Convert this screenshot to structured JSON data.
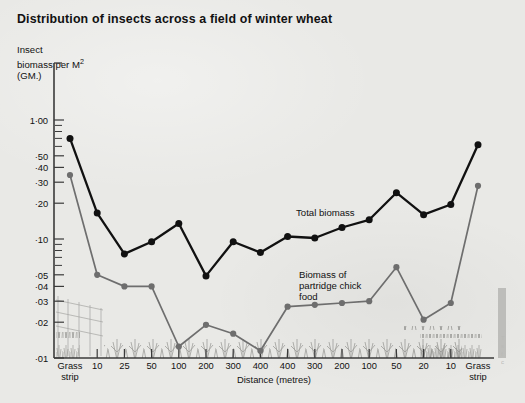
{
  "title": "Distribution of insects across a field of winter wheat",
  "y_axis_label_lines": "Insect\nbiomass per M²\n(GM.)",
  "x_axis_title": "Distance (metres)",
  "annotations": [
    {
      "name": "total-biomass-label",
      "text": "Total biomass",
      "x": 296,
      "y": 208
    },
    {
      "name": "partridge-food-label",
      "text": "Biomass of\npartridge chick\nfood",
      "x": 299,
      "y": 270
    }
  ],
  "right_caption": "T\ns\nf\nc",
  "colors": {
    "background": "#e9e9e6",
    "axis": "#3a3a3a",
    "total_biomass": "#111111",
    "partridge_food": "#6e6e6e",
    "text": "#111111"
  },
  "chart_data": {
    "type": "line",
    "title": "Distribution of insects across a field of winter wheat",
    "xlabel": "Distance (metres)",
    "ylabel": "Insect biomass per M2 (GM.)",
    "yscale": "log",
    "ylim": [
      0.01,
      1.0
    ],
    "grid": false,
    "legend": "inline-annotations",
    "ytick_labels": [
      "1·00",
      "·50",
      "·40",
      "·30",
      "·20",
      "·10",
      "·05",
      "·04",
      "·03",
      "·02",
      "·01"
    ],
    "ytick_values": [
      1.0,
      0.5,
      0.4,
      0.3,
      0.2,
      0.1,
      0.05,
      0.04,
      0.03,
      0.02,
      0.01
    ],
    "categories": [
      "Grass\nstrip",
      "10",
      "25",
      "50",
      "100",
      "200",
      "300",
      "400",
      "400",
      "300",
      "200",
      "100",
      "50",
      "20",
      "10",
      "Grass\nstrip"
    ],
    "series": [
      {
        "name": "Total biomass",
        "color": "#111111",
        "values": [
          0.7,
          0.165,
          0.075,
          0.095,
          0.135,
          0.049,
          0.095,
          0.077,
          0.105,
          0.102,
          0.125,
          0.145,
          0.245,
          0.16,
          0.195,
          0.62
        ]
      },
      {
        "name": "Biomass of partridge chick food",
        "color": "#6e6e6e",
        "values": [
          0.345,
          0.05,
          0.04,
          0.04,
          0.0125,
          0.019,
          0.016,
          0.0115,
          0.027,
          0.028,
          0.029,
          0.03,
          0.058,
          0.021,
          0.029,
          0.28
        ]
      }
    ]
  }
}
